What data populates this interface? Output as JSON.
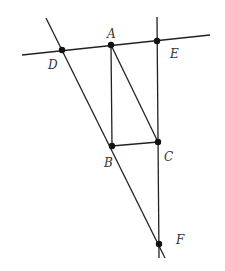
{
  "diagram": {
    "type": "geometry",
    "line_color": "#222222",
    "point_color": "#111111",
    "points": [
      {
        "id": "A",
        "label": "A",
        "x": 111,
        "y": 45,
        "lx": 107,
        "ly": 38
      },
      {
        "id": "B",
        "label": "B",
        "x": 112,
        "y": 146,
        "lx": 104,
        "ly": 167
      },
      {
        "id": "C",
        "label": "C",
        "x": 158,
        "y": 142,
        "lx": 164,
        "ly": 161
      },
      {
        "id": "D",
        "label": "D",
        "x": 62,
        "y": 50,
        "lx": 48,
        "ly": 69
      },
      {
        "id": "E",
        "label": "E",
        "x": 157,
        "y": 41,
        "lx": 170,
        "ly": 58
      },
      {
        "id": "F",
        "label": "F",
        "x": 159,
        "y": 244,
        "lx": 176,
        "ly": 244
      }
    ],
    "lines": [
      {
        "id": "line-DEA",
        "x1": 22,
        "y1": 55,
        "x2": 210,
        "y2": 35
      },
      {
        "id": "line-DBF",
        "x1": 46,
        "y1": 18,
        "x2": 165,
        "y2": 258
      },
      {
        "id": "line-ECF",
        "x1": 157,
        "y1": 17,
        "x2": 159,
        "y2": 258
      },
      {
        "id": "segment-AB",
        "x1": 111,
        "y1": 45,
        "x2": 112,
        "y2": 146
      },
      {
        "id": "segment-AC",
        "x1": 111,
        "y1": 45,
        "x2": 158,
        "y2": 142
      },
      {
        "id": "segment-BC",
        "x1": 112,
        "y1": 146,
        "x2": 158,
        "y2": 142
      }
    ]
  }
}
